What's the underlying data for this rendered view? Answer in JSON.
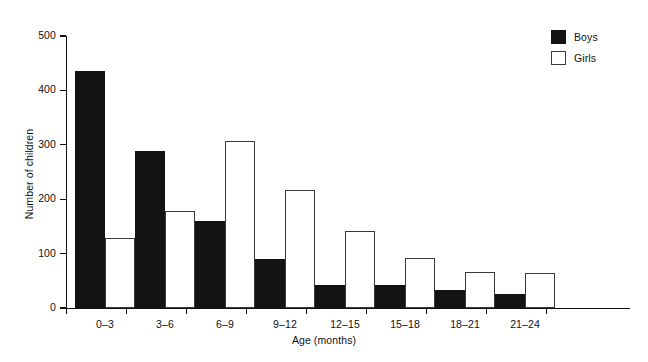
{
  "chart_data": {
    "type": "bar",
    "title": "",
    "xlabel": "Age (months)",
    "ylabel": "Number of children",
    "categories": [
      "0–3",
      "3–6",
      "6–9",
      "9–12",
      "12–15",
      "15–18",
      "18–21",
      "21–24"
    ],
    "series": [
      {
        "name": "Boys",
        "color": "#131313",
        "values": [
          435,
          288,
          160,
          90,
          42,
          42,
          34,
          26
        ]
      },
      {
        "name": "Girls",
        "color": "#ffffff",
        "values": [
          128,
          178,
          307,
          217,
          142,
          91,
          66,
          65
        ]
      }
    ],
    "ylim": [
      0,
      500
    ],
    "yticks": [
      0,
      100,
      200,
      300,
      400,
      500
    ],
    "ytick_labels": [
      "0",
      "100",
      "200",
      "300",
      "400",
      "500"
    ],
    "grid": false,
    "legend_position": "top-right"
  },
  "axes": {
    "y_title": "Number of children",
    "x_title": "Age (months)"
  },
  "legend": {
    "entries": [
      {
        "label": "Boys"
      },
      {
        "label": "Girls"
      }
    ]
  }
}
